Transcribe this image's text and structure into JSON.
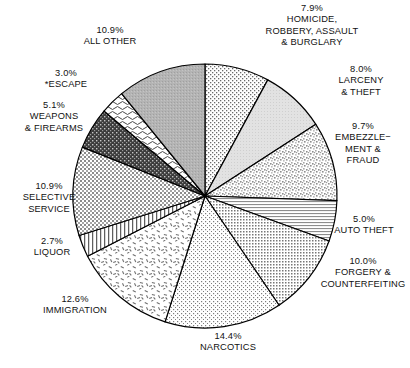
{
  "chart_data": {
    "type": "pie",
    "title": "",
    "subtitle": "",
    "xlabel": "",
    "ylabel": "",
    "legend_position": "none",
    "grid": false,
    "units": "percent",
    "total_labeled": "100.2",
    "footnote_marker": "*",
    "start_angle_deg": 0,
    "direction": "clockwise",
    "categories": [
      "HOMICIDE, ROBBERY, ASSAULT & BURGLARY",
      "LARCENY & THEFT",
      "EMBEZZLEMENT & FRAUD",
      "AUTO THEFT",
      "FORGERY & COUNTERFEITING",
      "NARCOTICS",
      "IMMIGRATION",
      "LIQUOR",
      "SELECTIVE SERVICE",
      "WEAPONS & FIREARMS",
      "*ESCAPE",
      "ALL OTHER"
    ],
    "values": [
      7.9,
      8.0,
      9.7,
      5.0,
      10.0,
      14.4,
      12.6,
      2.7,
      10.9,
      5.1,
      3.0,
      10.9
    ],
    "slices": [
      {
        "id": "homicide",
        "pct": "7.9%",
        "name_lines": [
          "HOMICIDE,",
          "ROBBERY, ASSAULT",
          "& BURGLARY"
        ],
        "value": 7.9,
        "fill": "p-dot-fine",
        "tone": "#efefef"
      },
      {
        "id": "larceny",
        "pct": "8.0%",
        "name_lines": [
          "LARCENY",
          "& THEFT"
        ],
        "value": 8.0,
        "fill": "p-tint-light",
        "tone": "#dcdcdc"
      },
      {
        "id": "embezzlement",
        "pct": "9.7%",
        "name_lines": [
          "EMBEZZLE−",
          "MENT &",
          "FRAUD"
        ],
        "value": 9.7,
        "fill": "p-speckle",
        "tone": "#d2d2d2"
      },
      {
        "id": "autotheft",
        "pct": "5.0%",
        "name_lines": [
          "AUTO THEFT"
        ],
        "value": 5.0,
        "fill": "p-hline",
        "tone": "#e6e6e6"
      },
      {
        "id": "forgery",
        "pct": "10.0%",
        "name_lines": [
          "FORGERY &",
          "COUNTERFEITING"
        ],
        "value": 10.0,
        "fill": "p-dotgrid",
        "tone": "#c9c9c9"
      },
      {
        "id": "narcotics",
        "pct": "14.4%",
        "name_lines": [
          "NARCOTICS"
        ],
        "value": 14.4,
        "fill": "p-dot-fine2",
        "tone": "#ececec"
      },
      {
        "id": "immigration",
        "pct": "12.6%",
        "name_lines": [
          "IMMIGRATION"
        ],
        "value": 12.6,
        "fill": "p-confetti",
        "tone": "#f2f2f2"
      },
      {
        "id": "liquor",
        "pct": "2.7%",
        "name_lines": [
          "LIQUOR"
        ],
        "value": 2.7,
        "fill": "p-vline",
        "tone": "#ffffff"
      },
      {
        "id": "selective",
        "pct": "10.9%",
        "name_lines": [
          "SELECTIVE",
          "SERVICE"
        ],
        "value": 10.9,
        "fill": "p-crosshatch",
        "tone": "#d8d8d8"
      },
      {
        "id": "weapons",
        "pct": "5.1%",
        "name_lines": [
          "WEAPONS",
          "& FIREARMS"
        ],
        "value": 5.1,
        "fill": "p-darkspeckle",
        "tone": "#8a8a8a"
      },
      {
        "id": "escape",
        "pct": "3.0%",
        "name_lines": [
          "*ESCAPE"
        ],
        "value": 3.0,
        "fill": "p-squiggle",
        "tone": "#ffffff"
      },
      {
        "id": "allother",
        "pct": "10.9%",
        "name_lines": [
          "ALL OTHER"
        ],
        "value": 10.9,
        "fill": "p-gray",
        "tone": "#b0b0b0"
      }
    ],
    "geometry": {
      "cx": 205,
      "cy": 196,
      "r": 132
    },
    "colors": {
      "stroke": "#000000",
      "text": "#111111",
      "background": "#ffffff"
    }
  }
}
